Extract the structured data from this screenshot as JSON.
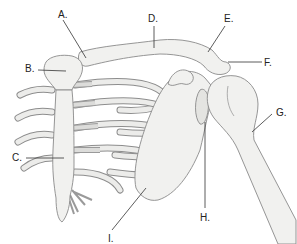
{
  "diagram": {
    "labels": [
      {
        "id": "A",
        "text": "A.",
        "x": 58,
        "y": 10,
        "points_to": "sternoclavicular joint"
      },
      {
        "id": "B",
        "text": "B.",
        "x": 25,
        "y": 64,
        "points_to": "manubrium"
      },
      {
        "id": "C",
        "text": "C.",
        "x": 12,
        "y": 153,
        "points_to": "sternum body"
      },
      {
        "id": "D",
        "text": "D.",
        "x": 148,
        "y": 14,
        "points_to": "clavicle"
      },
      {
        "id": "E",
        "text": "E.",
        "x": 224,
        "y": 14,
        "points_to": "acromioclavicular joint"
      },
      {
        "id": "F",
        "text": "F.",
        "x": 264,
        "y": 58,
        "points_to": "acromion"
      },
      {
        "id": "G",
        "text": "G.",
        "x": 276,
        "y": 108,
        "points_to": "humerus"
      },
      {
        "id": "H",
        "text": "H.",
        "x": 200,
        "y": 213,
        "points_to": "glenoid cavity"
      },
      {
        "id": "I",
        "text": "I.",
        "x": 108,
        "y": 234,
        "points_to": "scapula"
      }
    ]
  },
  "colors": {
    "bone_fill": "#f1f1ef",
    "bone_outline": "#8a8a8a",
    "label_text": "#222222",
    "background": "#ffffff"
  }
}
